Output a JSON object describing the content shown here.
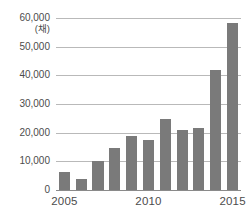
{
  "chart_data": {
    "type": "bar",
    "title": "",
    "subtitle": "",
    "xlabel": "",
    "ylabel": "",
    "unit_label": "(채)",
    "categories": [
      "2005",
      "2006",
      "2007",
      "2008",
      "2009",
      "2010",
      "2011",
      "2012",
      "2013",
      "2014",
      "2015"
    ],
    "values": [
      6300,
      3800,
      10100,
      14800,
      18700,
      17300,
      24600,
      20800,
      21700,
      41800,
      58200
    ],
    "series": [
      {
        "name": "",
        "values": [
          6300,
          3800,
          10100,
          14800,
          18700,
          17300,
          24600,
          20800,
          21700,
          41800,
          58200
        ]
      }
    ],
    "ylim": [
      0,
      60000
    ],
    "ytick_values": [
      0,
      10000,
      20000,
      30000,
      40000,
      50000,
      60000
    ],
    "ytick_labels": [
      "0",
      "10,000",
      "20,000",
      "30,000",
      "40,000",
      "50,000",
      "60,000"
    ],
    "xtick_labels": [
      "2005",
      "2010",
      "2015"
    ],
    "xtick_categories": [
      "2005",
      "2010",
      "2015"
    ],
    "grid": true,
    "legend": "none",
    "bar_color": "#7a7a7a",
    "grid_color": "#b9b9b9",
    "axis_color": "#8a8a8a",
    "text_color": "#4c4c4c"
  }
}
